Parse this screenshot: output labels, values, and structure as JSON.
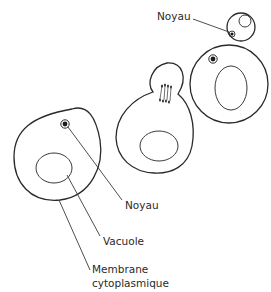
{
  "diagram": {
    "colors": {
      "stroke": "#2a2a2a",
      "background": "#ffffff"
    },
    "labels": {
      "noyau_top": "Noyau",
      "noyau_bottom": "Noyau",
      "vacuole": "Vacuole",
      "membrane_line1": "Membrane",
      "membrane_line2": "cytoplasmique"
    },
    "cells": [
      {
        "id": "mature-cell",
        "has_nucleus": true,
        "has_vacuole": true,
        "labelled": true
      },
      {
        "id": "budding-cell",
        "has_bud": true,
        "has_chromosomes": true,
        "has_vacuole": true
      },
      {
        "id": "mother-cell-right",
        "has_nucleus": true,
        "has_vacuole": true
      },
      {
        "id": "daughter-cell",
        "has_nucleus": true,
        "has_vacuole": true
      }
    ]
  }
}
